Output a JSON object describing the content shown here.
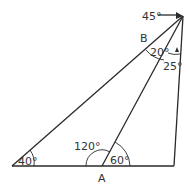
{
  "diagram": {
    "labels": {
      "top_angle": "45°",
      "point_b": "B",
      "angle_b_left": "20°",
      "angle_b_right": "25°",
      "angle_left": "40°",
      "angle_a_left": "120°",
      "angle_a_right": "60°",
      "point_a": "A"
    }
  }
}
